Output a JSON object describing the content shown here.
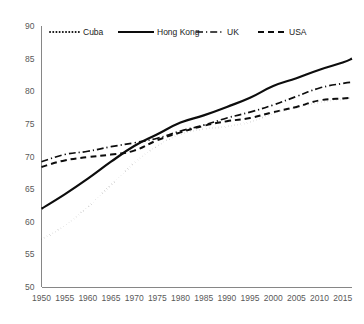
{
  "chart_data": {
    "type": "line",
    "title": "",
    "subtitle": "",
    "xlabel": "",
    "ylabel": "",
    "xlim": [
      1950,
      2017
    ],
    "ylim": [
      50,
      90
    ],
    "ytick_step": 5,
    "xtick_step": 5,
    "grid": false,
    "legend_position": "top",
    "xticks": [
      "1950",
      "1955",
      "1960",
      "1965",
      "1970",
      "1975",
      "1980",
      "1985",
      "1990",
      "1995",
      "2000",
      "2005",
      "2010",
      "2015"
    ],
    "yticks": [
      "50",
      "55",
      "60",
      "65",
      "70",
      "75",
      "80",
      "85",
      "90"
    ],
    "x": [
      1950,
      1955,
      1960,
      1965,
      1970,
      1975,
      1980,
      1985,
      1990,
      1995,
      2000,
      2005,
      2010,
      2015,
      2017
    ],
    "series": [
      {
        "name": "Cuba",
        "style": "dotted",
        "color": "#0d0d0d",
        "values": [
          57.3,
          59.4,
          62.3,
          65.6,
          69.0,
          71.6,
          73.4,
          74.2,
          74.6,
          75.3,
          76.6,
          77.5,
          78.3,
          78.8,
          79.0
        ]
      },
      {
        "name": "Hong Kong",
        "style": "solid",
        "color": "#0d0d0d",
        "values": [
          62.0,
          64.2,
          66.6,
          69.2,
          71.6,
          73.4,
          75.2,
          76.3,
          77.6,
          79.0,
          80.8,
          82.0,
          83.3,
          84.4,
          85.0
        ]
      },
      {
        "name": "UK",
        "style": "dash-dot",
        "color": "#0d0d0d",
        "values": [
          69.2,
          70.3,
          70.8,
          71.5,
          72.1,
          72.8,
          73.9,
          74.8,
          75.9,
          76.8,
          77.9,
          79.2,
          80.5,
          81.2,
          81.4
        ]
      },
      {
        "name": "USA",
        "style": "dashed",
        "color": "#0d0d0d",
        "values": [
          68.4,
          69.4,
          69.9,
          70.3,
          70.9,
          72.5,
          73.7,
          74.7,
          75.4,
          75.9,
          76.8,
          77.6,
          78.6,
          78.9,
          79.0
        ]
      }
    ]
  },
  "legend": {
    "entries": [
      {
        "label": "Cuba",
        "style": "dotted"
      },
      {
        "label": "Hong Kong",
        "style": "solid"
      },
      {
        "label": "UK",
        "style": "dash-dot"
      },
      {
        "label": "USA",
        "style": "dashed"
      }
    ]
  },
  "colors": {
    "series": "#0d0d0d",
    "axis": "#868686",
    "tick_text": "#595959",
    "legend_text": "#1a1a1a",
    "background": "#ffffff"
  }
}
